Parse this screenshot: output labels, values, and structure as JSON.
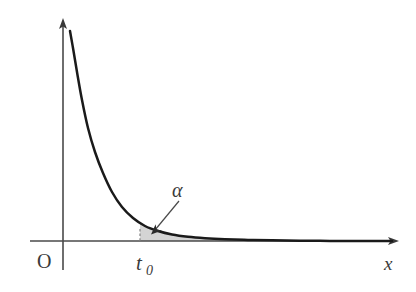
{
  "figure": {
    "title": "",
    "background_color": "#ffffff",
    "axis_color": "#4a4a4a",
    "curve_color": "#1a1a1a",
    "shade_fill": "#d4d4d4",
    "shade_stroke": "#9a9a9a",
    "annotation_color": "#3a3a3a",
    "labels": {
      "origin": "O",
      "x_axis": "x",
      "threshold": "t",
      "threshold_subscript": "0",
      "area": "α"
    }
  },
  "chart_data": {
    "type": "line",
    "title": "",
    "xlabel": "x",
    "ylabel": "",
    "grid": false,
    "legend": null,
    "axis_origin_label": "O",
    "axes": {
      "x_axis_y_pixel": 241,
      "y_axis_x_pixel": 63,
      "x_axis_start_pixel": 30,
      "x_axis_end_pixel": 399,
      "y_axis_top_pixel": 18,
      "y_axis_bottom_pixel": 270
    },
    "series": [
      {
        "name": "density-curve",
        "description": "monotonically decreasing convex density curve approaching the x-axis asymptotically",
        "x": [
          70,
          73,
          77,
          82,
          88,
          95,
          103,
          112,
          122,
          133,
          145,
          158,
          172,
          188,
          205,
          225,
          248,
          272,
          300,
          330,
          360,
          392
        ],
        "y": [
          31,
          48,
          72,
          100,
          128,
          152,
          173,
          192,
          207,
          218,
          226,
          231,
          234.5,
          236.8,
          238.2,
          239.2,
          239.9,
          240.3,
          240.7,
          240.9,
          241,
          241
        ]
      }
    ],
    "shaded_region": {
      "label": "α",
      "description": "tail area under the curve to the right of t0",
      "x_start": 140,
      "x_end": 240,
      "baseline_y": 241,
      "fill": "#d4d4d4"
    },
    "markers": [
      {
        "name": "t0",
        "label": "t",
        "subscript": "0",
        "x_pixel": 140,
        "kind": "dashed-vertical-line",
        "y_top": 229,
        "y_bottom": 241
      }
    ],
    "annotations": [
      {
        "name": "alpha-callout",
        "text": "α",
        "label_x": 173,
        "label_y": 196,
        "arrow_from": [
          179,
          201
        ],
        "arrow_to": [
          152,
          233
        ]
      }
    ]
  }
}
